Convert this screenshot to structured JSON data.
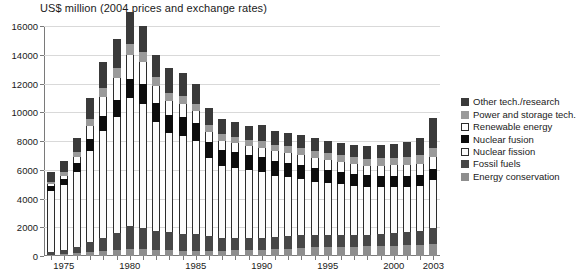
{
  "chart_data": {
    "type": "bar",
    "stacked": true,
    "title": "US$ million (2004 prices and exchange rates)",
    "xlabel": "",
    "ylabel": "",
    "ylim": [
      0,
      16000
    ],
    "ytick_labels": [
      "0",
      "2000",
      "4000",
      "6000",
      "8000",
      "10000",
      "12000",
      "14000",
      "16000"
    ],
    "ytick_values": [
      0,
      2000,
      4000,
      6000,
      8000,
      10000,
      12000,
      14000,
      16000
    ],
    "grid": true,
    "legend_position": "right",
    "categories": [
      1974,
      1975,
      1976,
      1977,
      1978,
      1979,
      1980,
      1981,
      1982,
      1983,
      1984,
      1985,
      1986,
      1987,
      1988,
      1989,
      1990,
      1991,
      1992,
      1993,
      1994,
      1995,
      1996,
      1997,
      1998,
      1999,
      2000,
      2001,
      2002,
      2003
    ],
    "xtick_labels": [
      "1975",
      "1980",
      "1985",
      "1990",
      "1995",
      "2000",
      "2003"
    ],
    "xtick_categories": [
      1975,
      1980,
      1985,
      1990,
      1995,
      2000,
      2003
    ],
    "series": [
      {
        "name": "Energy conservation",
        "color": "#8e8e8e",
        "values": [
          60,
          120,
          200,
          300,
          380,
          420,
          460,
          500,
          430,
          400,
          380,
          370,
          360,
          380,
          400,
          430,
          450,
          480,
          520,
          560,
          600,
          620,
          640,
          660,
          680,
          700,
          720,
          740,
          780,
          820
        ]
      },
      {
        "name": "Fossil fuels",
        "color": "#474747",
        "values": [
          230,
          300,
          420,
          680,
          900,
          1150,
          1600,
          1450,
          1300,
          1250,
          1180,
          1150,
          1050,
          900,
          850,
          820,
          800,
          820,
          860,
          900,
          880,
          860,
          840,
          820,
          800,
          820,
          860,
          900,
          980,
          1120
        ]
      },
      {
        "name": "Nuclear fission",
        "color": "#fbfbfb",
        "values": [
          4200,
          4500,
          5200,
          6300,
          7400,
          8100,
          8900,
          8600,
          7600,
          6900,
          6800,
          6500,
          5400,
          5000,
          4900,
          4700,
          4600,
          4300,
          4100,
          3900,
          3700,
          3600,
          3500,
          3400,
          3300,
          3250,
          3200,
          3150,
          3100,
          3350
        ]
      },
      {
        "name": "Nuclear fusion",
        "color": "#0d0d0d",
        "values": [
          380,
          450,
          620,
          850,
          1050,
          1200,
          1350,
          1400,
          1300,
          1250,
          1300,
          1250,
          1150,
          1100,
          1080,
          1050,
          1020,
          1000,
          980,
          950,
          920,
          900,
          880,
          860,
          840,
          830,
          820,
          810,
          800,
          780
        ]
      },
      {
        "name": "Renewable energy",
        "color": "#fdfdfd",
        "values": [
          120,
          220,
          420,
          900,
          1300,
          1500,
          1700,
          1550,
          1200,
          1000,
          900,
          820,
          700,
          640,
          620,
          640,
          660,
          680,
          700,
          720,
          740,
          720,
          700,
          680,
          660,
          680,
          700,
          720,
          760,
          800
        ]
      },
      {
        "name": "Power and storage tech.",
        "color": "#9a9a9a",
        "values": [
          180,
          260,
          380,
          520,
          640,
          700,
          760,
          700,
          600,
          560,
          540,
          520,
          460,
          440,
          430,
          440,
          450,
          460,
          470,
          480,
          490,
          480,
          470,
          480,
          500,
          520,
          540,
          560,
          600,
          640
        ]
      },
      {
        "name": "Other tech./research",
        "color": "#3a3a3a",
        "values": [
          680,
          750,
          960,
          1450,
          1830,
          2030,
          2230,
          1800,
          1570,
          1740,
          1620,
          1390,
          1180,
          1040,
          1020,
          980,
          1120,
          960,
          920,
          890,
          860,
          840,
          830,
          850,
          880,
          900,
          960,
          1020,
          1180,
          2090
        ]
      }
    ],
    "totals": [
      5850,
      6600,
      8200,
      11000,
      13500,
      15100,
      17000,
      16000,
      14000,
      13100,
      12720,
      12000,
      10260,
      9500,
      9300,
      9060,
      9100,
      8700,
      8550,
      8400,
      8190,
      8020,
      7860,
      7750,
      7660,
      7700,
      7800,
      7900,
      8200,
      9600
    ]
  },
  "legend": {
    "items": [
      {
        "label": "Other tech./research",
        "color": "#3a3a3a",
        "swatch": "filled"
      },
      {
        "label": "Power and storage tech.",
        "color": "#9a9a9a",
        "swatch": "filled"
      },
      {
        "label": "Renewable energy",
        "color": "#fdfdfd",
        "swatch": "outlined"
      },
      {
        "label": "Nuclear fusion",
        "color": "#0d0d0d",
        "swatch": "filled"
      },
      {
        "label": "Nuclear fission",
        "color": "#fbfbfb",
        "swatch": "outlined"
      },
      {
        "label": "Fossil fuels",
        "color": "#474747",
        "swatch": "filled"
      },
      {
        "label": "Energy conservation",
        "color": "#8e8e8e",
        "swatch": "filled"
      }
    ]
  }
}
